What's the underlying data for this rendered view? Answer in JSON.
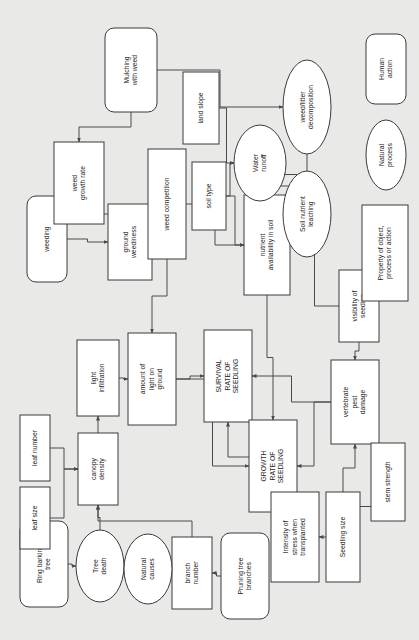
{
  "diagram": {
    "orientation": "rotated-90-clockwise",
    "background_color": "#e9e9e7",
    "node_fill": "#ffffff",
    "node_stroke": "#3b3b3b",
    "edge_color": "#4a4a4a",
    "legend": {
      "items": [
        {
          "id": "legend-human-action",
          "label": "Human\naction",
          "shape": "rounded-rect"
        },
        {
          "id": "legend-natural-process",
          "label": "Natural\nprocess",
          "shape": "ellipse"
        },
        {
          "id": "legend-property",
          "label": "Property of object,\nprocess or action",
          "shape": "rect"
        }
      ]
    },
    "nodes": [
      {
        "id": "mulching-with-weed",
        "label": "Mulching\nwith weed",
        "shape": "rounded-rect",
        "x": 105,
        "y": 28,
        "w": 52,
        "h": 84
      },
      {
        "id": "weeding",
        "label": "weeding",
        "shape": "rounded-rect",
        "x": 27,
        "y": 196,
        "w": 40,
        "h": 86
      },
      {
        "id": "ring-barking-tree",
        "label": "Ring barking\ntree",
        "shape": "rounded-rect",
        "x": 20,
        "y": 521,
        "w": 48,
        "h": 86
      },
      {
        "id": "pruning-tree-branches",
        "label": "Pruning tree\nbranches",
        "shape": "rounded-rect",
        "x": 221,
        "y": 533,
        "w": 48,
        "h": 86
      },
      {
        "id": "weed-growth-rate",
        "label": "weed\ngrowth rate",
        "shape": "rect",
        "x": 54,
        "y": 142,
        "w": 50,
        "h": 82
      },
      {
        "id": "ground-weediness",
        "label": "ground\nweediness",
        "shape": "rect",
        "x": 108,
        "y": 204,
        "w": 44,
        "h": 76
      },
      {
        "id": "weed-competition",
        "label": "weed competition",
        "shape": "rect",
        "x": 148,
        "y": 149,
        "w": 38,
        "h": 110
      },
      {
        "id": "land-slope",
        "label": "land slope",
        "shape": "rect",
        "x": 183,
        "y": 72,
        "w": 36,
        "h": 72
      },
      {
        "id": "soil-type",
        "label": "soil type",
        "shape": "rect",
        "x": 192,
        "y": 162,
        "w": 34,
        "h": 68
      },
      {
        "id": "nutrient-availability",
        "label": "nutrient\navailability in soil",
        "shape": "rect",
        "x": 244,
        "y": 195,
        "w": 46,
        "h": 100
      },
      {
        "id": "light-infiltration",
        "label": "light\ninfiltration",
        "shape": "rect",
        "x": 77,
        "y": 340,
        "w": 42,
        "h": 76
      },
      {
        "id": "amount-of-light",
        "label": "amount of\nlight on\nground",
        "shape": "rect",
        "x": 128,
        "y": 333,
        "w": 48,
        "h": 92
      },
      {
        "id": "canopy-density",
        "label": "canopy\ndensity",
        "shape": "rect",
        "x": 78,
        "y": 433,
        "w": 40,
        "h": 72
      },
      {
        "id": "leaf-number",
        "label": "leaf number",
        "shape": "rect",
        "x": 20,
        "y": 415,
        "w": 30,
        "h": 66
      },
      {
        "id": "leaf-size",
        "label": "leaf size",
        "shape": "rect",
        "x": 20,
        "y": 487,
        "w": 30,
        "h": 62
      },
      {
        "id": "branch-number",
        "label": "branch\nnumber",
        "shape": "rect",
        "x": 172,
        "y": 537,
        "w": 40,
        "h": 72
      },
      {
        "id": "survival-rate-of-seedling",
        "label": "SURVIVAL\nRATE OF\nSEEDLING",
        "shape": "rect",
        "x": 204,
        "y": 330,
        "w": 48,
        "h": 92
      },
      {
        "id": "growth-rate-of-seedling",
        "label": "GROWTH\nRATE OF\nSEEDLING",
        "shape": "rect",
        "x": 249,
        "y": 420,
        "w": 48,
        "h": 92
      },
      {
        "id": "visibility-of-seedling",
        "label": "visibility of\nseeding",
        "shape": "rect",
        "x": 339,
        "y": 270,
        "w": 40,
        "h": 72
      },
      {
        "id": "vertebrate-pest-damage",
        "label": "vertebrate\npest\ndamage",
        "shape": "rect",
        "x": 331,
        "y": 360,
        "w": 48,
        "h": 84
      },
      {
        "id": "stem-strength",
        "label": "stem strength",
        "shape": "rect",
        "x": 371,
        "y": 443,
        "w": 34,
        "h": 78
      },
      {
        "id": "seedling-size",
        "label": "Seedling size",
        "shape": "rect",
        "x": 326,
        "y": 492,
        "w": 34,
        "h": 90
      },
      {
        "id": "intensity-of-stress",
        "label": "Intensity of\nstress when\ntransplanted",
        "shape": "rect",
        "x": 271,
        "y": 492,
        "w": 48,
        "h": 90
      },
      {
        "id": "water-runoff",
        "label": "Water\nrunoff",
        "shape": "ellipse",
        "x": 234,
        "y": 125,
        "w": 52,
        "h": 76
      },
      {
        "id": "weed-litter-decomposition",
        "label": "weed/litter\ndecomposition",
        "shape": "ellipse",
        "x": 283,
        "y": 60,
        "w": 48,
        "h": 94
      },
      {
        "id": "soil-nutrient-leaching",
        "label": "Soil nutrient\nleaching",
        "shape": "ellipse",
        "x": 283,
        "y": 171,
        "w": 48,
        "h": 86
      },
      {
        "id": "tree-death",
        "label": "Tree\ndeath",
        "shape": "ellipse",
        "x": 76,
        "y": 530,
        "w": 48,
        "h": 72
      },
      {
        "id": "natural-causes",
        "label": "Natural\ncauses",
        "shape": "ellipse",
        "x": 124,
        "y": 534,
        "w": 48,
        "h": 70
      }
    ],
    "edges": [
      {
        "from": "weeding",
        "to": "weed-growth-rate"
      },
      {
        "from": "weeding",
        "to": "ground-weediness"
      },
      {
        "from": "mulching-with-weed",
        "to": "weed-growth-rate"
      },
      {
        "from": "mulching-with-weed",
        "to": "weed-litter-decomposition"
      },
      {
        "from": "weed-growth-rate",
        "to": "ground-weediness"
      },
      {
        "from": "ground-weediness",
        "to": "weed-competition"
      },
      {
        "from": "weed-competition",
        "to": "nutrient-availability"
      },
      {
        "from": "weed-competition",
        "to": "amount-of-light"
      },
      {
        "from": "land-slope",
        "to": "water-runoff"
      },
      {
        "from": "soil-type",
        "to": "water-runoff"
      },
      {
        "from": "soil-type",
        "to": "nutrient-availability"
      },
      {
        "from": "water-runoff",
        "to": "soil-nutrient-leaching"
      },
      {
        "from": "soil-nutrient-leaching",
        "to": "nutrient-availability"
      },
      {
        "from": "weed-litter-decomposition",
        "to": "nutrient-availability"
      },
      {
        "from": "nutrient-availability",
        "to": "growth-rate-of-seedling"
      },
      {
        "from": "light-infiltration",
        "to": "amount-of-light"
      },
      {
        "from": "canopy-density",
        "to": "light-infiltration"
      },
      {
        "from": "leaf-number",
        "to": "canopy-density"
      },
      {
        "from": "leaf-size",
        "to": "canopy-density"
      },
      {
        "from": "tree-death",
        "to": "canopy-density"
      },
      {
        "from": "ring-barking-tree",
        "to": "tree-death"
      },
      {
        "from": "natural-causes",
        "to": "tree-death"
      },
      {
        "from": "branch-number",
        "to": "canopy-density"
      },
      {
        "from": "natural-causes",
        "to": "branch-number"
      },
      {
        "from": "pruning-tree-branches",
        "to": "branch-number"
      },
      {
        "from": "amount-of-light",
        "to": "survival-rate-of-seedling"
      },
      {
        "from": "amount-of-light",
        "to": "growth-rate-of-seedling"
      },
      {
        "from": "survival-rate-of-seedling",
        "to": "growth-rate-of-seedling"
      },
      {
        "from": "visibility-of-seedling",
        "to": "vertebrate-pest-damage"
      },
      {
        "from": "vertebrate-pest-damage",
        "to": "survival-rate-of-seedling"
      },
      {
        "from": "vertebrate-pest-damage",
        "to": "growth-rate-of-seedling"
      },
      {
        "from": "stem-strength",
        "to": "vertebrate-pest-damage"
      },
      {
        "from": "seedling-size",
        "to": "stem-strength"
      },
      {
        "from": "seedling-size",
        "to": "intensity-of-stress"
      },
      {
        "from": "seedling-size",
        "to": "vertebrate-pest-damage"
      },
      {
        "from": "intensity-of-stress",
        "to": "survival-rate-of-seedling"
      },
      {
        "from": "visibility-of-seedling",
        "to": "nutrient-availability"
      }
    ]
  }
}
